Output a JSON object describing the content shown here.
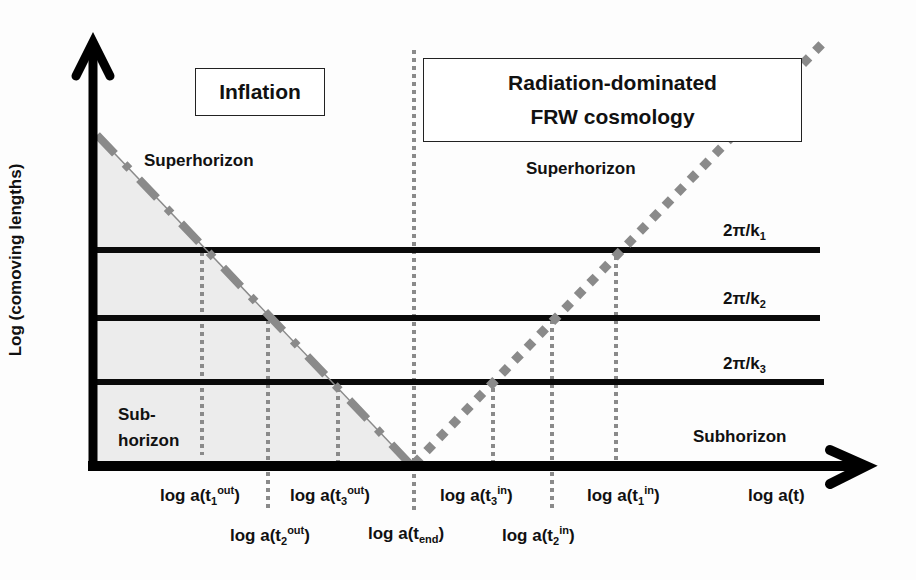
{
  "diagram": {
    "title_boxes": {
      "inflation": "Inflation",
      "radiation_line1": "Radiation-dominated",
      "radiation_line2": "FRW cosmology"
    },
    "axes": {
      "y_label": "Log (comoving lengths)",
      "x_label": "log a(t)"
    },
    "regions": {
      "superhorizon_left": "Superhorizon",
      "superhorizon_right": "Superhorizon",
      "subhorizon_left_line1": "Sub-",
      "subhorizon_left_line2": "horizon",
      "subhorizon_right": "Subhorizon"
    },
    "wavelengths": [
      {
        "base": "2π/k",
        "sub": "1"
      },
      {
        "base": "2π/k",
        "sub": "2"
      },
      {
        "base": "2π/k",
        "sub": "3"
      }
    ],
    "x_ticks": {
      "t1_out": {
        "pre": "log a(t",
        "sub": "1",
        "sup": "out",
        "post": ")"
      },
      "t2_out": {
        "pre": "log a(t",
        "sub": "2",
        "sup": "out",
        "post": ")"
      },
      "t3_out": {
        "pre": "log a(t",
        "sub": "3",
        "sup": "out",
        "post": ")"
      },
      "t_end": {
        "pre": "log a(t",
        "sub": "end",
        "post": ")"
      },
      "t3_in": {
        "pre": "log a(t",
        "sub": "3",
        "sup": "in",
        "post": ")"
      },
      "t2_in": {
        "pre": "log a(t",
        "sub": "2",
        "sup": "in",
        "post": ")"
      },
      "t1_in": {
        "pre": "log a(t",
        "sub": "1",
        "sup": "in",
        "post": ")"
      }
    },
    "colors": {
      "axis": "#000000",
      "horizon_line": "#8a8a8a",
      "shaded_region": "#ececec",
      "dotted_guides": "#8a8a8a"
    }
  }
}
